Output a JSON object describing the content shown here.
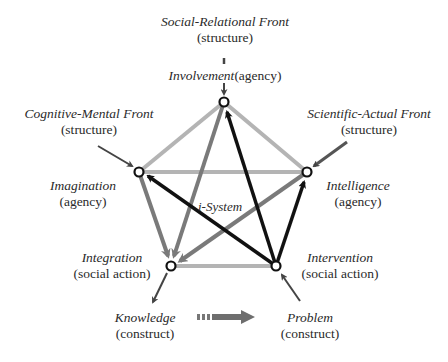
{
  "diagram": {
    "center_label": "i-System",
    "fronts": [
      {
        "id": "social",
        "name": "Social-Relational Front",
        "type": "(structure)"
      },
      {
        "id": "cognitive",
        "name": "Cognitive-Mental Front",
        "type": "(structure)"
      },
      {
        "id": "scientific",
        "name": "Scientific-Actual Front",
        "type": "(structure)"
      }
    ],
    "nodes": [
      {
        "id": "involvement",
        "name": "Involvement",
        "type": "(agency)"
      },
      {
        "id": "imagination",
        "name": "Imagination",
        "type": "(agency)"
      },
      {
        "id": "intelligence",
        "name": "Intelligence",
        "type": "(agency)"
      },
      {
        "id": "integration",
        "name": "Integration",
        "type": "(social action)"
      },
      {
        "id": "intervention",
        "name": "Intervention",
        "type": "(social action)"
      }
    ],
    "constructs": [
      {
        "id": "knowledge",
        "name": "Knowledge",
        "type": "(construct)"
      },
      {
        "id": "problem",
        "name": "Problem",
        "type": "(construct)"
      }
    ],
    "colors": {
      "light_edge": "#b4b4b4",
      "mid_edge": "#7a7a7a",
      "dark_edge": "#111111"
    }
  }
}
